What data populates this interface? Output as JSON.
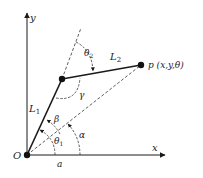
{
  "diagram": {
    "labels": {
      "y_axis": "y",
      "x_axis": "x",
      "origin": "O",
      "link1": "L",
      "link1_sub": "1",
      "link2": "L",
      "link2_sub": "2",
      "end_effector": "p (x,y,θ)",
      "theta1": "θ",
      "theta1_sub": "1",
      "theta2": "θ",
      "theta2_sub": "2",
      "beta": "β",
      "gamma": "γ",
      "alpha": "α",
      "a_label": "a"
    },
    "colors": {
      "stroke": "#1a1a1a",
      "link": "#1a1a1a",
      "dash": "#333333"
    }
  }
}
